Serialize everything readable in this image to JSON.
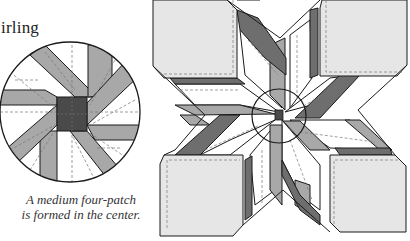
{
  "title": "irling",
  "caption": {
    "line1": "A medium four-patch",
    "line2": "is formed in the center."
  },
  "colors": {
    "light": "#e6e6e6",
    "white": "#ffffff",
    "medium": "#a8a8a8",
    "dark": "#6e6e6e",
    "center": "#4a4a4a",
    "stroke": "#1a1a1a",
    "seam": "#777777"
  },
  "figures": [
    {
      "name": "detail-circle",
      "description": "Close-up circle of the center showing a four-patch"
    },
    {
      "name": "quilt-block",
      "description": "Whirling star block with four corner squares and a circled center"
    }
  ]
}
